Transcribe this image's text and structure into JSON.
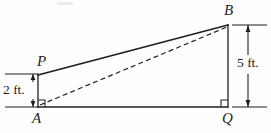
{
  "figure": {
    "background_color": "#fefefe",
    "stroke_color": "#231f20",
    "labels": {
      "vertex_p": "P",
      "vertex_b": "B",
      "vertex_a": "A",
      "vertex_q": "Q"
    },
    "dimensions": {
      "left_height": "2 ft.",
      "right_height": "5 ft."
    },
    "geometry": {
      "point_a": {
        "x": 38,
        "y": 107
      },
      "point_q": {
        "x": 228,
        "y": 107
      },
      "point_b": {
        "x": 228,
        "y": 25
      },
      "point_p": {
        "x": 38,
        "y": 75
      },
      "solid_edges": [
        {
          "name": "segment-PB",
          "from": "P",
          "to": "B"
        },
        {
          "name": "segment-PA",
          "from": "P",
          "to": "A"
        },
        {
          "name": "segment-AQ",
          "from": "A",
          "to": "Q"
        },
        {
          "name": "segment-QB",
          "from": "Q",
          "to": "B"
        }
      ],
      "dashed_edges": [
        {
          "name": "segment-AB",
          "from": "A",
          "to": "B"
        }
      ],
      "right_angles": [
        {
          "at": "A",
          "orientation": "opens-right"
        },
        {
          "at": "Q",
          "orientation": "opens-left"
        }
      ]
    },
    "dimension_lines": {
      "left": {
        "axis_x": 33,
        "top_y": 74,
        "bottom_y": 107,
        "extension_x_start": 5,
        "extension_x_end": 39
      },
      "right": {
        "axis_x": 248,
        "top_y": 25,
        "bottom_y": 107,
        "extension_x_start": 232,
        "extension_x_end": 267
      }
    }
  }
}
